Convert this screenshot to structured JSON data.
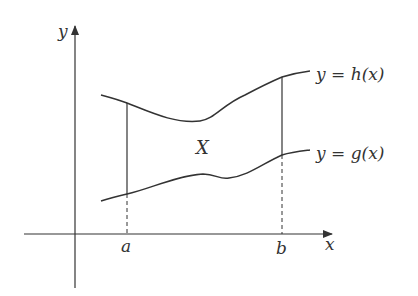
{
  "diagram": {
    "axis_labels": {
      "x": "x",
      "y": "y"
    },
    "points": {
      "a": "a",
      "b": "b"
    },
    "region_label": "X",
    "curve_labels": {
      "upper": {
        "lhs": "y",
        "eq": " = ",
        "fn": "h",
        "arg": "(x)"
      },
      "lower": {
        "lhs": "y",
        "eq": " = ",
        "fn": "g",
        "arg": "(x)"
      }
    },
    "colors": {
      "stroke": "#333333",
      "background": "#ffffff"
    }
  }
}
